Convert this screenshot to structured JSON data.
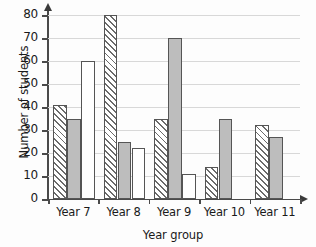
{
  "chart_data": {
    "type": "bar",
    "title": "",
    "xlabel": "Year group",
    "ylabel": "Number of students",
    "categories": [
      "Year 7",
      "Year 8",
      "Year 9",
      "Year 10",
      "Year 11"
    ],
    "ylim": [
      0,
      80
    ],
    "ytick_labels": [
      "80",
      "70",
      "60",
      "50",
      "40",
      "30",
      "20",
      "10",
      "0"
    ],
    "ytick_values": [
      80,
      70,
      60,
      50,
      40,
      30,
      20,
      10,
      0
    ],
    "grid": true,
    "legend_position": "none",
    "series": [
      {
        "name": "series-hatched",
        "style": "diagonal-hatch",
        "values": [
          41,
          80,
          35,
          14,
          32
        ]
      },
      {
        "name": "series-gray",
        "style": "solid-gray",
        "values": [
          35,
          25,
          70,
          35,
          27
        ]
      },
      {
        "name": "series-white",
        "style": "solid-white",
        "values": [
          60,
          22,
          11,
          0,
          0
        ]
      }
    ]
  }
}
